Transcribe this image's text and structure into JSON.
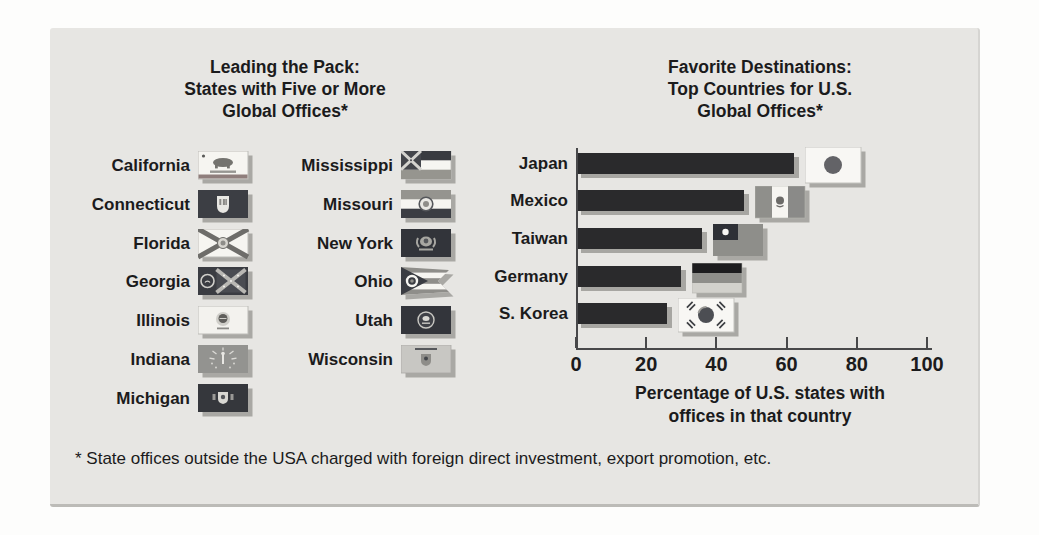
{
  "figure": {
    "left": {
      "title_lines": [
        "Leading the Pack:",
        "States with Five or More",
        "Global Offices*"
      ],
      "columns": [
        {
          "items": [
            {
              "label": "California",
              "icon": "california-flag-icon"
            },
            {
              "label": "Connecticut",
              "icon": "connecticut-flag-icon"
            },
            {
              "label": "Florida",
              "icon": "florida-flag-icon"
            },
            {
              "label": "Georgia",
              "icon": "georgia-flag-icon"
            },
            {
              "label": "Illinois",
              "icon": "illinois-flag-icon"
            },
            {
              "label": "Indiana",
              "icon": "indiana-flag-icon"
            },
            {
              "label": "Michigan",
              "icon": "michigan-flag-icon"
            }
          ]
        },
        {
          "items": [
            {
              "label": "Mississippi",
              "icon": "mississippi-flag-icon"
            },
            {
              "label": "Missouri",
              "icon": "missouri-flag-icon"
            },
            {
              "label": "New York",
              "icon": "new-york-flag-icon"
            },
            {
              "label": "Ohio",
              "icon": "ohio-flag-icon"
            },
            {
              "label": "Utah",
              "icon": "utah-flag-icon"
            },
            {
              "label": "Wisconsin",
              "icon": "wisconsin-flag-icon"
            }
          ]
        }
      ]
    },
    "right": {
      "title_lines": [
        "Favorite Destinations:",
        "Top Countries for U.S.",
        "Global Offices*"
      ],
      "xlabel_lines": [
        "Percentage of U.S. states with",
        "offices in that country"
      ]
    },
    "footnote": "* State offices outside the USA charged with foreign direct investment, export promotion, etc.",
    "colors": {
      "panel_bg": "#e7e6e3",
      "bar": "#2a2a2c",
      "shadow": "#a7a6a2",
      "axis": "#48484a",
      "text": "#1b1b1c"
    }
  },
  "chart_data": [
    {
      "type": "table",
      "title": "Leading the Pack: States with Five or More Global Offices*",
      "items": [
        "California",
        "Connecticut",
        "Florida",
        "Georgia",
        "Illinois",
        "Indiana",
        "Michigan",
        "Mississippi",
        "Missouri",
        "New York",
        "Ohio",
        "Utah",
        "Wisconsin"
      ]
    },
    {
      "type": "bar",
      "orientation": "horizontal",
      "title": "Favorite Destinations: Top Countries for U.S. Global Offices*",
      "categories": [
        "Japan",
        "Mexico",
        "Taiwan",
        "Germany",
        "S. Korea"
      ],
      "values": [
        62,
        48,
        36,
        30,
        26
      ],
      "icons": [
        "japan-flag-icon",
        "mexico-flag-icon",
        "taiwan-flag-icon",
        "germany-flag-icon",
        "s-korea-flag-icon"
      ],
      "xlabel": "Percentage of U.S. states with offices in that country",
      "xlim": [
        0,
        100
      ],
      "xticks": [
        0,
        20,
        40,
        60,
        80,
        100
      ],
      "grid": false,
      "legend": false
    }
  ]
}
